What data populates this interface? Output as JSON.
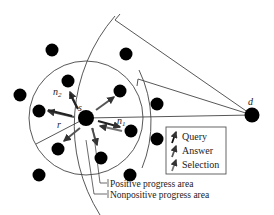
{
  "diagram": {
    "type": "network-routing",
    "nodes": {
      "source_label": "s",
      "destination_label": "d",
      "neighbor_1_label": "n",
      "neighbor_1_sub": "1",
      "neighbor_2_label": "n",
      "neighbor_2_sub": "2",
      "radius_label": "r"
    },
    "legend": {
      "items": [
        {
          "label": "Query",
          "icon": "query-arrow-icon"
        },
        {
          "label": "Answer",
          "icon": "answer-arrow-icon"
        },
        {
          "label": "Selection",
          "icon": "selection-arrow-icon"
        }
      ]
    },
    "annotations": {
      "positive": "Positive progress area",
      "nonpositive": "Nonpositive progress area"
    },
    "colors": {
      "node": "#000000",
      "line": "#444444",
      "arrow_dark": "#1a1a1a",
      "arrow_gray": "#777777"
    }
  }
}
